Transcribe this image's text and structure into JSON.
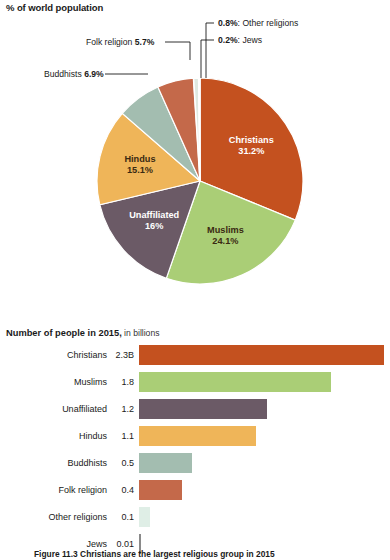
{
  "pie_title": "% of world population",
  "bar_title_strong": "Number of people in 2015,",
  "bar_title_light": " in billions",
  "caption": "Figure 11.3   Christians are the largest religious group in 2015",
  "callouts": {
    "other_religions": {
      "value": "0.8%",
      "sep": ": ",
      "label": "Other religions"
    },
    "jews": {
      "value": "0.2%",
      "sep": ": ",
      "label": "Jews"
    },
    "folk_religion": {
      "label": "Folk religion ",
      "value": "5.7%"
    },
    "buddhists": {
      "label": "Buddhists ",
      "value": "6.9%"
    }
  },
  "chart_data": [
    {
      "type": "pie",
      "title": "% of world population",
      "ylabel": "",
      "xlabel": "",
      "unit": "percent of world population",
      "start_angle_deg": 0,
      "direction": "clockwise",
      "legend": "none (direct labels)",
      "slices": [
        {
          "name": "Christians",
          "value": 31.2,
          "label": "Christians",
          "value_label": "31.2%",
          "color": "#c4511f",
          "label_placement": "inside",
          "text_color": "light"
        },
        {
          "name": "Muslims",
          "value": 24.1,
          "label": "Muslims",
          "value_label": "24.1%",
          "color": "#aace76",
          "label_placement": "inside",
          "text_color": "dark"
        },
        {
          "name": "Unaffiliated",
          "value": 16.0,
          "label": "Unaffiliated",
          "value_label": "16%",
          "color": "#6b5a66",
          "label_placement": "inside",
          "text_color": "light"
        },
        {
          "name": "Hindus",
          "value": 15.1,
          "label": "Hindus",
          "value_label": "15.1%",
          "color": "#efb559",
          "label_placement": "inside",
          "text_color": "dark"
        },
        {
          "name": "Buddhists",
          "value": 6.9,
          "label": "Buddhists",
          "value_label": "6.9%",
          "color": "#a3bdb0",
          "label_placement": "callout",
          "text_color": "dark"
        },
        {
          "name": "Folk religion",
          "value": 5.7,
          "label": "Folk religion",
          "value_label": "5.7%",
          "color": "#c4694a",
          "label_placement": "callout",
          "text_color": "dark"
        },
        {
          "name": "Other religions",
          "value": 0.8,
          "label": "Other religions",
          "value_label": "0.8%",
          "color": "#dfe9e1",
          "label_placement": "callout",
          "text_color": "dark"
        },
        {
          "name": "Jews",
          "value": 0.2,
          "label": "Jews",
          "value_label": "0.2%",
          "color": "#b8b8b8",
          "label_placement": "callout",
          "text_color": "dark"
        }
      ]
    },
    {
      "type": "bar",
      "orientation": "horizontal",
      "title": "Number of people in 2015, in billions",
      "xlabel": "billions of people",
      "ylabel": "",
      "xlim": [
        0,
        2.3
      ],
      "grid": false,
      "legend": "none",
      "categories": [
        "Christians",
        "Muslims",
        "Unaffiliated",
        "Hindus",
        "Buddhists",
        "Folk religion",
        "Other religions",
        "Jews"
      ],
      "values": [
        2.3,
        1.8,
        1.2,
        1.1,
        0.5,
        0.4,
        0.1,
        0.01
      ],
      "value_labels": [
        "2.3B",
        "1.8",
        "1.2",
        "1.1",
        "0.5",
        "0.4",
        "0.1",
        "0.01"
      ],
      "colors": [
        "#c4511f",
        "#aace76",
        "#6b5a66",
        "#efb559",
        "#a3bdb0",
        "#c4694a",
        "#dfeee6",
        "#8a8a8a"
      ]
    }
  ]
}
